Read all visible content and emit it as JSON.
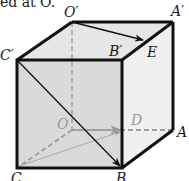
{
  "caption": "ed at O.",
  "figure": {
    "type": "cube",
    "vertices": {
      "O_prime": {
        "label": "O′",
        "x": 72,
        "y": 22
      },
      "A_prime": {
        "label": "A′",
        "x": 173,
        "y": 22
      },
      "C_prime": {
        "label": "C′",
        "x": 17,
        "y": 60
      },
      "B_prime": {
        "label": "B′",
        "x": 122,
        "y": 60
      },
      "C": {
        "label": "C",
        "x": 17,
        "y": 168
      },
      "B": {
        "label": "B",
        "x": 122,
        "y": 168
      },
      "A": {
        "label": "A",
        "x": 173,
        "y": 130
      },
      "O": {
        "label": "O",
        "x": 72,
        "y": 130
      },
      "D": {
        "label": "D",
        "x": 122,
        "y": 130
      },
      "E": {
        "label": "E",
        "x": 145,
        "y": 40
      }
    },
    "labels": {
      "O_prime": "O′",
      "A_prime": "A′",
      "C_prime": "C′",
      "B_prime": "B′",
      "E": "E",
      "O": "O",
      "D": "D",
      "A": "A",
      "C": "C",
      "B": "B"
    },
    "vectors": [
      "O′→E",
      "C′→B",
      "O→D",
      "C→D"
    ],
    "colors": {
      "edge": "#111111",
      "hidden_edge": "#a0a0a0",
      "front_face": "#dcdcdc",
      "top_face": "#e6e6e6",
      "side_face": "#efefef"
    }
  }
}
